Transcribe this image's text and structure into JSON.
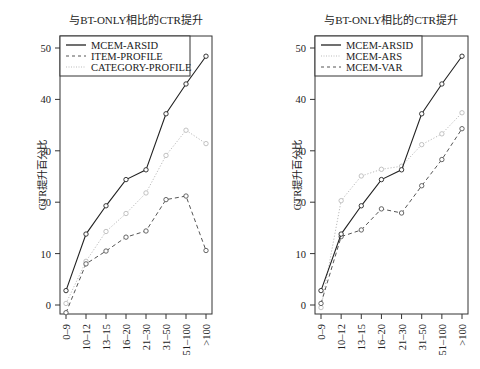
{
  "chart_data": [
    {
      "type": "line",
      "title": "与BT-ONLY相比的CTR提升",
      "xlabel": "",
      "ylabel": "CTR提升百分比",
      "categories": [
        "0–9",
        "10–12",
        "13–15",
        "16–20",
        "21–30",
        "31–50",
        "51–100",
        ">100"
      ],
      "yticks": [
        0,
        10,
        20,
        30,
        40,
        50
      ],
      "ylim": [
        -2,
        52
      ],
      "grid": false,
      "legend_position": "top-left",
      "series": [
        {
          "name": "MCEM-ARSID",
          "style": "solid",
          "color": "#222222",
          "values": [
            2.8,
            13.8,
            19.3,
            24.4,
            26.3,
            37.2,
            43.0,
            48.4
          ]
        },
        {
          "name": "ITEM-PROFILE",
          "style": "dashed",
          "color": "#555555",
          "values": [
            -1.5,
            8.0,
            10.5,
            13.2,
            14.4,
            20.5,
            21.2,
            10.6
          ]
        },
        {
          "name": "CATEGORY-PROFILE",
          "style": "dotted",
          "color": "#bbbbbb",
          "values": [
            0.3,
            8.5,
            14.3,
            17.8,
            21.8,
            29.1,
            34.0,
            31.4
          ]
        }
      ]
    },
    {
      "type": "line",
      "title": "与BT-ONLY相比的CTR提升",
      "xlabel": "",
      "ylabel": "CTR提升百分比",
      "categories": [
        "0–9",
        "10–12",
        "13–15",
        "16–20",
        "21–30",
        "31–50",
        "51–100",
        ">100"
      ],
      "yticks": [
        0,
        10,
        20,
        30,
        40,
        50
      ],
      "ylim": [
        -2,
        52
      ],
      "grid": false,
      "legend_position": "top-left",
      "series": [
        {
          "name": "MCEM-ARSID",
          "style": "solid",
          "color": "#222222",
          "values": [
            2.8,
            13.8,
            19.3,
            24.4,
            26.3,
            37.2,
            43.0,
            48.4
          ]
        },
        {
          "name": "MCEM-ARS",
          "style": "dotted",
          "color": "#bbbbbb",
          "values": [
            -0.5,
            20.3,
            25.1,
            26.4,
            27.0,
            31.2,
            33.3,
            37.4
          ]
        },
        {
          "name": "MCEM-VAR",
          "style": "dashed",
          "color": "#555555",
          "values": [
            0.3,
            13.3,
            14.6,
            18.7,
            17.9,
            23.2,
            28.3,
            34.3
          ]
        }
      ]
    }
  ]
}
